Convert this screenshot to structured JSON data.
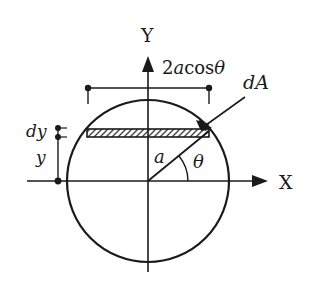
{
  "diagram": {
    "labels": {
      "y_axis": "Y",
      "x_axis": "X",
      "width_dim": "2acosθ",
      "width_dim_prefix": "2",
      "width_dim_a": "a",
      "width_dim_cos": "cos",
      "width_dim_theta": "θ",
      "dA": "dA",
      "dA_d": "d",
      "dA_A": "A",
      "dy": "dy",
      "y": "y",
      "radius": "a",
      "angle": "θ"
    },
    "colors": {
      "stroke": "#1a1a1a",
      "background": "#ffffff"
    }
  }
}
